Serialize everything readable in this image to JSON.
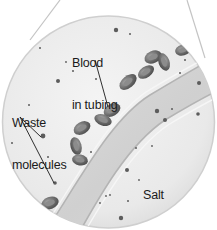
{
  "figure": {
    "type": "magnified-callout",
    "colors": {
      "background": "#ffffff",
      "circle_fill": "#ececec",
      "circle_edge": "#c8c8c8",
      "tubing_fill": "#d9d9d9",
      "tubing_wall": "#b8b8b8",
      "blood_cell": "#6e6e6e",
      "molecule": "#5a5a5a",
      "leader_line": "#1a1a1a"
    }
  },
  "labels": {
    "blood": {
      "line1": "Blood",
      "line2": "in tubing"
    },
    "waste": {
      "line1": "Waste",
      "line2": "molecules"
    },
    "salt": {
      "line1": "Salt",
      "line2": "solution"
    }
  }
}
